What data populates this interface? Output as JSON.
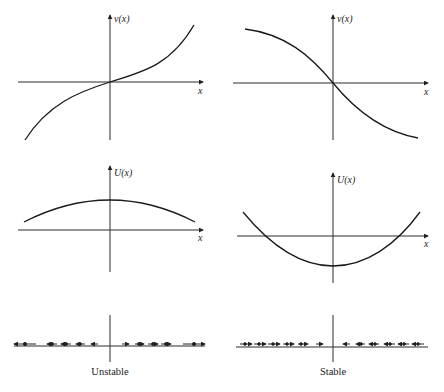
{
  "figure": {
    "panels": [
      {
        "id": "v-unstable",
        "y_label": "v(x)",
        "x_label": "x",
        "description": "increasing v(x) through origin"
      },
      {
        "id": "v-stable",
        "y_label": "v(x)",
        "x_label": "x",
        "description": "decreasing v(x) through origin"
      },
      {
        "id": "U-unstable",
        "y_label": "U(x)",
        "x_label": "x",
        "description": "potential hill with maximum at x=0"
      },
      {
        "id": "U-stable",
        "y_label": "U(x)",
        "x_label": "x",
        "description": "potential well with minimum at x=0"
      }
    ],
    "phase_lines": [
      {
        "id": "phase-unstable",
        "caption": "Unstable",
        "flow": "away from origin"
      },
      {
        "id": "phase-stable",
        "caption": "Stable",
        "flow": "toward origin"
      }
    ]
  }
}
